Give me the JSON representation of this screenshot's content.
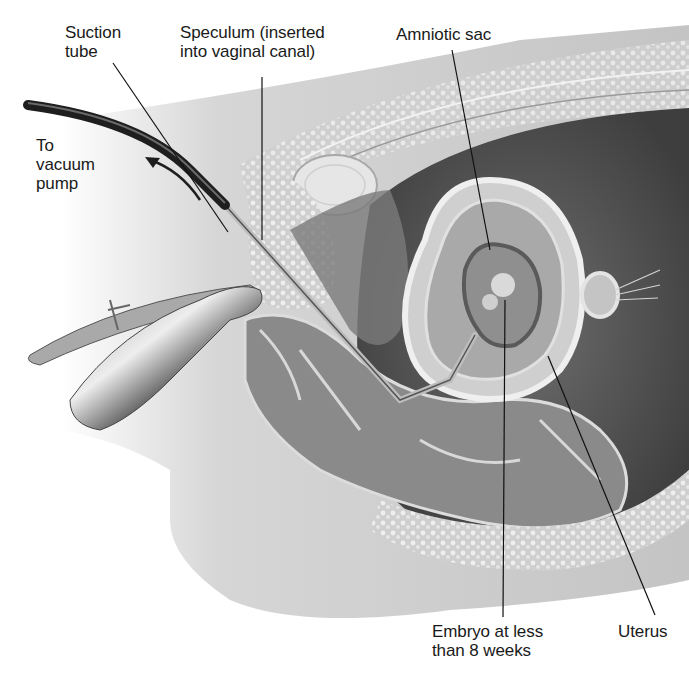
{
  "figure": {
    "labels": {
      "suction_tube": "Suction\ntube",
      "speculum": "Speculum (inserted\ninto vaginal canal)",
      "amniotic_sac": "Amniotic sac",
      "to_vacuum_pump": "To\nvacuum\npump",
      "embryo": "Embryo at less\nthan 8 weeks",
      "uterus": "Uterus"
    },
    "colors": {
      "background": "#ffffff",
      "skin": "#c9c9c9",
      "tissue_dark": "#5a5a5a",
      "tissue_mid": "#8c8c8c",
      "tissue_light": "#dcdcdc",
      "tube": "#1e1e1e",
      "leader_line": "#111111",
      "text": "#1a1a1a"
    }
  }
}
